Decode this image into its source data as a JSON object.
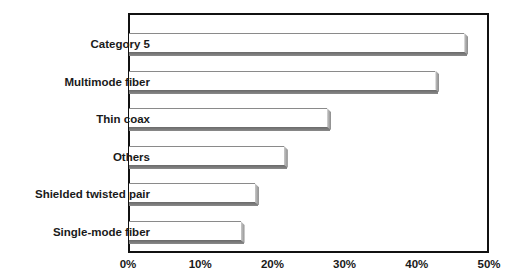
{
  "chart_data": {
    "type": "bar",
    "orientation": "horizontal",
    "title": "",
    "xlabel": "",
    "ylabel": "",
    "categories": [
      "Category 5",
      "Multimode fiber",
      "Thin coax",
      "Others",
      "Shielded twisted pair",
      "Single-mode fiber"
    ],
    "values": [
      47,
      43,
      28,
      22,
      18,
      16
    ],
    "unit": "%",
    "xlim": [
      0,
      50
    ],
    "x_ticks": [
      "0%",
      "10%",
      "20%",
      "30%",
      "40%",
      "50%"
    ],
    "grid": false,
    "legend": null,
    "style": "3D bars, white face with gray shading"
  },
  "colors": {
    "bar_face": "#ffffff",
    "bar_shadow": "#6a6a6a",
    "axis": "#111111",
    "text": "#1a1a1a"
  }
}
